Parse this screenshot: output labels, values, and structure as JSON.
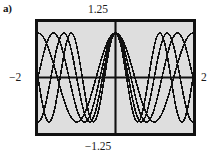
{
  "figure": {
    "panel_letter": "a)",
    "background_color": "#ffffff",
    "frame_color": "#111111",
    "plot_background_color": "#dedede",
    "curve_color": "#111111"
  },
  "labels": {
    "top": "1.25",
    "bottom": "−1.25",
    "left": "−2",
    "right": "2"
  },
  "chart_data": {
    "type": "line",
    "title": "",
    "xlabel": "",
    "ylabel": "",
    "xlim": [
      -2,
      2
    ],
    "ylim": [
      -1.25,
      1.25
    ],
    "grid": false,
    "legend": "none",
    "axes_shown": [
      "x-axis at y=0",
      "y-axis at x=0"
    ],
    "x_tick_labels": [
      "−2",
      "2"
    ],
    "y_tick_labels": [
      "−1.25",
      "1.25"
    ],
    "series": [
      {
        "name": "curve-1",
        "kind": "cosine",
        "amplitude": 1.0,
        "frequency": 2.0,
        "phase": 0.0
      },
      {
        "name": "curve-2",
        "kind": "cosine",
        "amplitude": 1.0,
        "frequency": 2.5,
        "phase": 0.0
      },
      {
        "name": "curve-3",
        "kind": "cosine",
        "amplitude": 1.0,
        "frequency": 3.0,
        "phase": 0.0
      },
      {
        "name": "curve-4",
        "kind": "cosine",
        "amplitude": 1.0,
        "frequency": 3.5,
        "phase": 0.0
      }
    ]
  }
}
